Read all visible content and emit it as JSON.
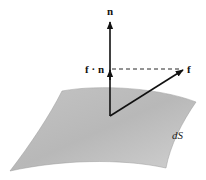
{
  "diagram": {
    "labels": {
      "normal": "n",
      "projection": "f · n",
      "vector": "f",
      "surface": "dS"
    },
    "colors": {
      "surface_light": "#d8d8d8",
      "surface_dark": "#a9a9a9",
      "ink": "#111111"
    }
  }
}
